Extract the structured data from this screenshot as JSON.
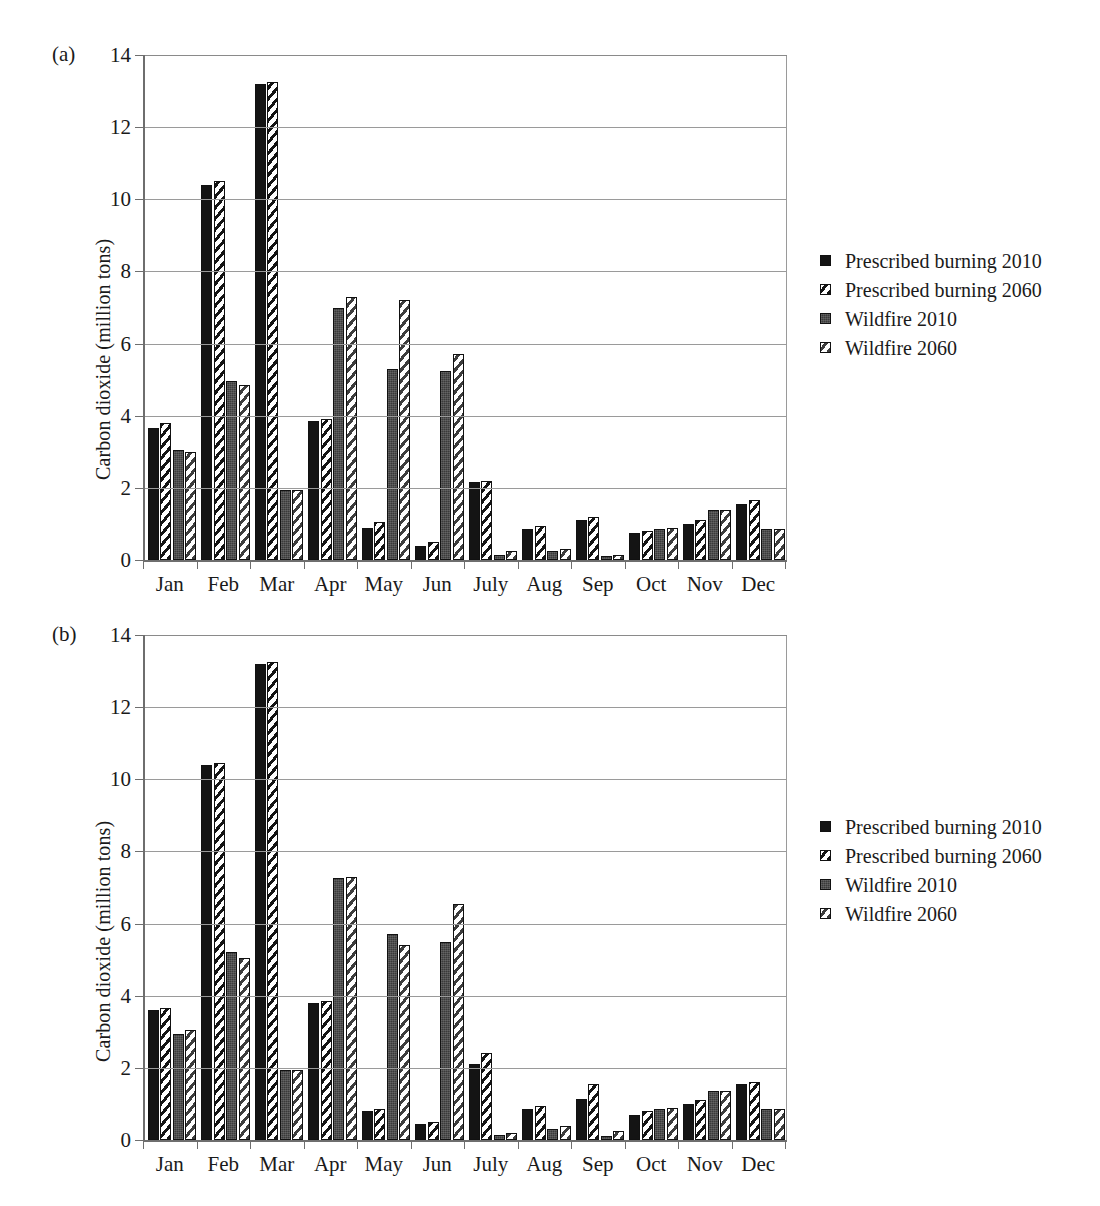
{
  "figure": {
    "panels": [
      {
        "tag": "(a)",
        "ylabel": "Carbon dioxide (million tons)",
        "yticks": [
          0,
          2,
          4,
          6,
          8,
          10,
          12,
          14
        ],
        "ylim": [
          0,
          14
        ],
        "categories": [
          "Jan",
          "Feb",
          "Mar",
          "Apr",
          "May",
          "Jun",
          "July",
          "Aug",
          "Sep",
          "Oct",
          "Nov",
          "Dec"
        ],
        "legend": [
          "Prescribed burning 2010",
          "Prescribed burning 2060",
          "Wildfire 2010",
          "Wildfire 2060"
        ]
      },
      {
        "tag": "(b)",
        "ylabel": "Carbon dioxide (million tons)",
        "yticks": [
          0,
          2,
          4,
          6,
          8,
          10,
          12,
          14
        ],
        "ylim": [
          0,
          14
        ],
        "categories": [
          "Jan",
          "Feb",
          "Mar",
          "Apr",
          "May",
          "Jun",
          "July",
          "Aug",
          "Sep",
          "Oct",
          "Nov",
          "Dec"
        ],
        "legend": [
          "Prescribed burning 2010",
          "Prescribed burning 2060",
          "Wildfire 2010",
          "Wildfire 2060"
        ]
      }
    ]
  },
  "chart_data": [
    {
      "type": "bar",
      "panel": "(a)",
      "title": "",
      "xlabel": "",
      "ylabel": "Carbon dioxide (million tons)",
      "ylim": [
        0,
        14
      ],
      "yticks": [
        0,
        2,
        4,
        6,
        8,
        10,
        12,
        14
      ],
      "grid": true,
      "legend_position": "right",
      "categories": [
        "Jan",
        "Feb",
        "Mar",
        "Apr",
        "May",
        "Jun",
        "July",
        "Aug",
        "Sep",
        "Oct",
        "Nov",
        "Dec"
      ],
      "series": [
        {
          "name": "Prescribed burning 2010",
          "values": [
            3.65,
            10.4,
            13.2,
            3.85,
            0.9,
            0.4,
            2.15,
            0.85,
            1.1,
            0.75,
            1.0,
            1.55
          ]
        },
        {
          "name": "Prescribed burning 2060",
          "values": [
            3.8,
            10.5,
            13.25,
            3.9,
            1.05,
            0.5,
            2.2,
            0.95,
            1.2,
            0.8,
            1.1,
            1.65
          ]
        },
        {
          "name": "Wildfire 2010",
          "values": [
            3.05,
            4.95,
            1.95,
            7.0,
            5.3,
            5.25,
            0.15,
            0.25,
            0.1,
            0.85,
            1.4,
            0.85
          ]
        },
        {
          "name": "Wildfire 2060",
          "values": [
            3.0,
            4.85,
            1.95,
            7.3,
            7.2,
            5.7,
            0.25,
            0.3,
            0.15,
            0.9,
            1.4,
            0.85
          ]
        }
      ]
    },
    {
      "type": "bar",
      "panel": "(b)",
      "title": "",
      "xlabel": "",
      "ylabel": "Carbon dioxide (million tons)",
      "ylim": [
        0,
        14
      ],
      "yticks": [
        0,
        2,
        4,
        6,
        8,
        10,
        12,
        14
      ],
      "grid": true,
      "legend_position": "right",
      "categories": [
        "Jan",
        "Feb",
        "Mar",
        "Apr",
        "May",
        "Jun",
        "July",
        "Aug",
        "Sep",
        "Oct",
        "Nov",
        "Dec"
      ],
      "series": [
        {
          "name": "Prescribed burning 2010",
          "values": [
            3.6,
            10.4,
            13.2,
            3.8,
            0.8,
            0.45,
            2.1,
            0.85,
            1.15,
            0.7,
            1.0,
            1.55
          ]
        },
        {
          "name": "Prescribed burning 2060",
          "values": [
            3.65,
            10.45,
            13.25,
            3.85,
            0.85,
            0.5,
            2.4,
            0.95,
            1.55,
            0.8,
            1.1,
            1.6
          ]
        },
        {
          "name": "Wildfire 2010",
          "values": [
            2.95,
            5.2,
            1.95,
            7.25,
            5.7,
            5.5,
            0.15,
            0.3,
            0.1,
            0.85,
            1.35,
            0.85
          ]
        },
        {
          "name": "Wildfire 2060",
          "values": [
            3.05,
            5.05,
            1.95,
            7.3,
            5.4,
            6.55,
            0.2,
            0.4,
            0.25,
            0.9,
            1.35,
            0.85
          ]
        }
      ]
    }
  ]
}
